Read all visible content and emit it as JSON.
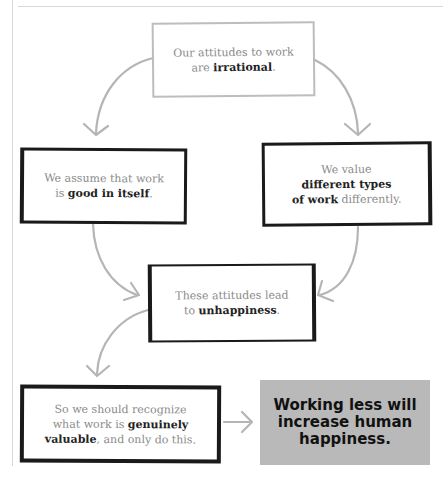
{
  "diagram": {
    "type": "argument-flowchart",
    "nodes": [
      {
        "id": "premise",
        "text_before": "Our attitudes to work",
        "text_mid": "are ",
        "bold": "irrational",
        "text_after": ".",
        "style": "light-grey-border"
      },
      {
        "id": "assume",
        "text_before": "We assume that work",
        "text_mid": "is ",
        "bold": "good in itself",
        "text_after": ".",
        "style": "black-border"
      },
      {
        "id": "value",
        "text_before": "We value",
        "bold": "different types of work",
        "bold_line1": "different types",
        "bold_line2": "of work",
        "text_after": " differently.",
        "style": "black-border"
      },
      {
        "id": "unhappy",
        "text_before": "These attitudes lead",
        "text_mid": "to ",
        "bold": "unhappiness",
        "text_after": ".",
        "style": "black-border"
      },
      {
        "id": "recognize",
        "text_before": "So we should recognize",
        "text_mid": "what work is ",
        "bold": "genuinely",
        "bold2": "valuable",
        "text_after": ", and only do this.",
        "style": "black-border"
      },
      {
        "id": "conclusion",
        "line1": "Working less will",
        "line2": "increase human",
        "line3": "happiness.",
        "style": "grey-fill",
        "fill_color": "#b9b9b9"
      }
    ],
    "edges": [
      {
        "from": "premise",
        "to": "assume"
      },
      {
        "from": "premise",
        "to": "value"
      },
      {
        "from": "assume",
        "to": "unhappy"
      },
      {
        "from": "value",
        "to": "unhappy"
      },
      {
        "from": "unhappy",
        "to": "recognize"
      },
      {
        "from": "recognize",
        "to": "conclusion"
      }
    ],
    "arrow_color": "#b5b5b5"
  }
}
